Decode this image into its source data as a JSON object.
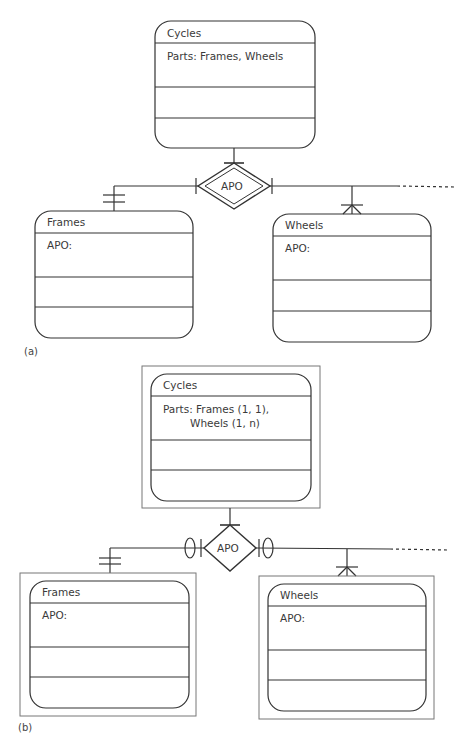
{
  "diagram_a": {
    "caption": "(a)",
    "relationship": {
      "label": "APO",
      "style": "double-diamond"
    },
    "entities": [
      {
        "id": "cycles",
        "title": "Cycles",
        "attribute_lines": [
          "Parts: Frames, Wheels"
        ]
      },
      {
        "id": "frames",
        "title": "Frames",
        "attribute_lines": [
          "APO:"
        ]
      },
      {
        "id": "wheels",
        "title": "Wheels",
        "attribute_lines": [
          "APO:"
        ]
      }
    ],
    "cardinalities": {
      "cycles": "one",
      "frames": "one-and-only-one",
      "wheels": "many"
    }
  },
  "diagram_b": {
    "caption": "(b)",
    "relationship": {
      "label": "APO",
      "style": "diamond-with-optional-markers"
    },
    "entities": [
      {
        "id": "cycles",
        "title": "Cycles",
        "attribute_lines": [
          "Parts: Frames (1, 1),",
          "Wheels (1, n)"
        ]
      },
      {
        "id": "frames",
        "title": "Frames",
        "attribute_lines": [
          "APO:"
        ]
      },
      {
        "id": "wheels",
        "title": "Wheels",
        "attribute_lines": [
          "APO:"
        ]
      }
    ],
    "cardinalities": {
      "cycles": "one",
      "frames": "one-and-only-one",
      "wheels": "many"
    }
  },
  "colors": {
    "stroke": "#333333",
    "frame": "#777777",
    "text": "#3a3a3a"
  }
}
